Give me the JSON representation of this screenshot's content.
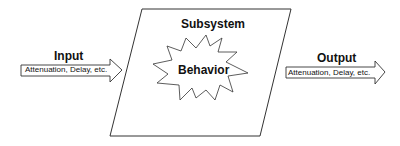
{
  "diagram": {
    "input": {
      "title": "Input",
      "arrow_label": "Attenuation, Delay, etc."
    },
    "subsystem": {
      "title": "Subsystem",
      "core_label": "Behavior"
    },
    "output": {
      "title": "Output",
      "arrow_label": "Attenuation, Delay, etc."
    },
    "colors": {
      "stroke": "#333333",
      "fill": "#ffffff",
      "text": "#111111"
    }
  }
}
